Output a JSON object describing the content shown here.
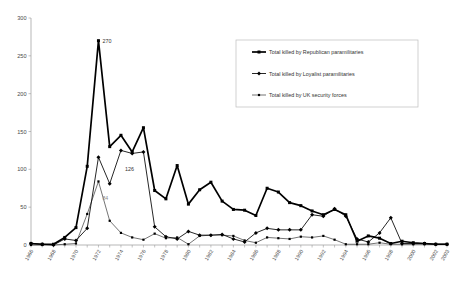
{
  "chart_data": {
    "type": "line",
    "title": "",
    "subtitle": "",
    "xlabel": "",
    "ylabel": "",
    "ylim": [
      0,
      300
    ],
    "yticks": [
      0,
      50,
      100,
      150,
      200,
      250,
      300
    ],
    "ytick_labels": [
      "0",
      "50",
      "100",
      "150",
      "200",
      "250",
      "300"
    ],
    "grid": false,
    "legend_position": "upper-right",
    "x": [
      1966,
      1967,
      1968,
      1969,
      1970,
      1971,
      1972,
      1973,
      1974,
      1975,
      1976,
      1977,
      1978,
      1979,
      1980,
      1981,
      1982,
      1983,
      1984,
      1985,
      1986,
      1987,
      1988,
      1989,
      1990,
      1991,
      1992,
      1993,
      1994,
      1995,
      1996,
      1997,
      1998,
      1999,
      2000,
      2001,
      2002,
      2003
    ],
    "xtick_labels": [
      "1966",
      "1968",
      "1970",
      "1972",
      "1974",
      "1976",
      "1978",
      "1980",
      "1982",
      "1984",
      "1986",
      "1988",
      "1990",
      "1992",
      "1994",
      "1996",
      "1998",
      "2000",
      "2002",
      "2003"
    ],
    "xtick_years": [
      1966,
      1968,
      1970,
      1972,
      1974,
      1976,
      1978,
      1980,
      1982,
      1984,
      1986,
      1988,
      1990,
      1992,
      1994,
      1996,
      1998,
      2000,
      2002,
      2003
    ],
    "series": [
      {
        "name": "Total killed by Republican paramilitaries",
        "marker": "square",
        "values": [
          2,
          1,
          1,
          10,
          23,
          104,
          270,
          130,
          145,
          123,
          155,
          72,
          61,
          105,
          54,
          73,
          83,
          58,
          47,
          46,
          39,
          75,
          70,
          56,
          52,
          45,
          40,
          47,
          40,
          5,
          12,
          9,
          2,
          5,
          3,
          2,
          1,
          1
        ]
      },
      {
        "name": "Total killed by Loyalist paramilitaries",
        "marker": "diamond",
        "values": [
          2,
          1,
          0,
          8,
          6,
          22,
          116,
          81,
          125,
          121,
          123,
          24,
          11,
          8,
          18,
          13,
          13,
          14,
          8,
          4,
          16,
          22,
          20,
          20,
          20,
          40,
          38,
          48,
          38,
          8,
          4,
          16,
          36,
          2,
          2,
          2,
          1,
          1
        ]
      },
      {
        "name": "Total killed by UK security forces",
        "marker": "plus",
        "values": [
          0,
          0,
          0,
          1,
          2,
          41,
          84,
          32,
          16,
          10,
          7,
          15,
          9,
          10,
          1,
          12,
          13,
          13,
          12,
          6,
          3,
          10,
          9,
          8,
          11,
          10,
          12,
          7,
          1,
          1,
          1,
          3,
          1,
          1,
          1,
          1,
          1,
          1
        ]
      }
    ],
    "annotations": [
      {
        "label": "270",
        "x": 1972,
        "y": 270,
        "series": "Total killed by Republican paramilitaries"
      },
      {
        "label": "126",
        "x": 1974,
        "y": 100,
        "series": "Total killed by Loyalist paramilitaries"
      },
      {
        "label": "84",
        "x": 1972,
        "y": 62,
        "series": "Total killed by UK security forces"
      }
    ]
  },
  "legend": {
    "entries": [
      {
        "label": "Total killed by Republican paramilitaries"
      },
      {
        "label": "Total killed by Loyalist paramilitaries"
      },
      {
        "label": "Total killed by UK security forces"
      }
    ]
  }
}
